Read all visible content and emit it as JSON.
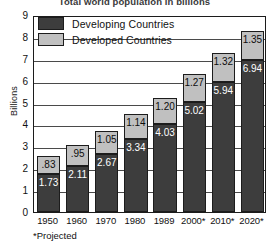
{
  "chart_data": {
    "type": "bar",
    "title": "Total world population in billions",
    "xlabel": "",
    "ylabel": "Billions",
    "ylim": [
      0,
      9
    ],
    "yticks": [
      0,
      1,
      2,
      3,
      4,
      5,
      6,
      7,
      8,
      9
    ],
    "grid": true,
    "stacked": true,
    "legend_position": "top-left",
    "categories": [
      "1950",
      "1960",
      "1970",
      "1980",
      "1989",
      "2000*",
      "2010*",
      "2020*"
    ],
    "series": [
      {
        "name": "Developing Countries",
        "color": "#3d3d3d",
        "values": [
          1.73,
          2.11,
          2.67,
          3.34,
          4.03,
          5.02,
          5.94,
          6.94
        ],
        "labels": [
          "1.73",
          "2.11",
          "2.67",
          "3.34",
          "4.03",
          "5.02",
          "5.94",
          "6.94"
        ]
      },
      {
        "name": "Developed Countries",
        "color": "#c0c0c0",
        "values": [
          0.83,
          0.95,
          1.05,
          1.14,
          1.2,
          1.27,
          1.32,
          1.35
        ],
        "labels": [
          ".83",
          ".95",
          "1.05",
          "1.14",
          "1.20",
          "1.27",
          "1.32",
          "1.35"
        ]
      }
    ],
    "totals": [
      2.56,
      3.06,
      3.72,
      4.48,
      5.23,
      6.29,
      7.26,
      8.29
    ],
    "annotations": [
      "*Projected"
    ]
  },
  "legend": {
    "items": [
      {
        "label": "Developing Countries",
        "color": "#3d3d3d"
      },
      {
        "label": "Developed Countries",
        "color": "#c0c0c0"
      }
    ]
  },
  "footnote": "*Projected",
  "colors": {
    "developing": "#3d3d3d",
    "developed": "#c0c0c0",
    "frame": "#1c1c1c",
    "background": "#ffffff"
  }
}
